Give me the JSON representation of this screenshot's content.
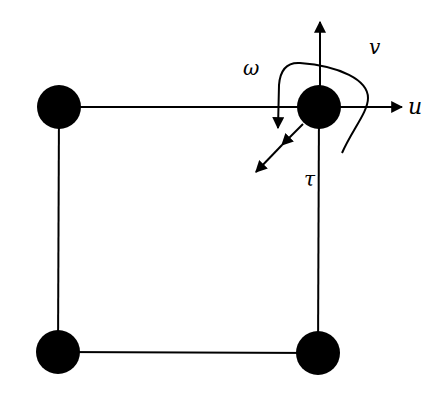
{
  "diagram": {
    "type": "beam-frame-element-dof",
    "colors": {
      "background": "#ffffff",
      "stroke": "#000000",
      "node_fill": "#000000"
    },
    "nodes": [
      {
        "id": "top-left",
        "x": 59,
        "y": 107,
        "r": 22
      },
      {
        "id": "top-right",
        "x": 319,
        "y": 107,
        "r": 22
      },
      {
        "id": "bottom-left",
        "x": 58,
        "y": 352,
        "r": 22
      },
      {
        "id": "bottom-right",
        "x": 318,
        "y": 353,
        "r": 22
      }
    ],
    "edges": [
      {
        "from": "top-left",
        "to": "top-right"
      },
      {
        "from": "top-left",
        "to": "bottom-left"
      },
      {
        "from": "bottom-left",
        "to": "bottom-right"
      },
      {
        "from": "top-right",
        "to": "bottom-right"
      }
    ],
    "dof_labels": {
      "u": "u",
      "v": "v",
      "omega": "ω",
      "tau": "τ"
    },
    "dof_descriptions": {
      "u": "horizontal displacement (arrow pointing right)",
      "v": "vertical displacement (arrow pointing up)",
      "omega": "rotation (curved arrow around node)",
      "tau": "twist / out-of-plane (double-headed diagonal arrow)"
    }
  }
}
